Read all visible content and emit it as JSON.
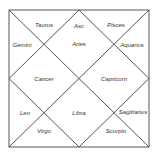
{
  "chart": {
    "style": "North Indian birth chart",
    "houses": [
      {
        "house": 1,
        "sign": "Aries",
        "note": "Asc"
      },
      {
        "house": 2,
        "sign": "Taurus"
      },
      {
        "house": 3,
        "sign": "Gemini"
      },
      {
        "house": 4,
        "sign": "Cancer"
      },
      {
        "house": 5,
        "sign": "Leo"
      },
      {
        "house": 6,
        "sign": "Virgo"
      },
      {
        "house": 7,
        "sign": "Libra"
      },
      {
        "house": 8,
        "sign": "Scorpio"
      },
      {
        "house": 9,
        "sign": "Sagittarius"
      },
      {
        "house": 10,
        "sign": "Capricorn"
      },
      {
        "house": 11,
        "sign": "Aquarius"
      },
      {
        "house": 12,
        "sign": "Pisces"
      }
    ]
  }
}
